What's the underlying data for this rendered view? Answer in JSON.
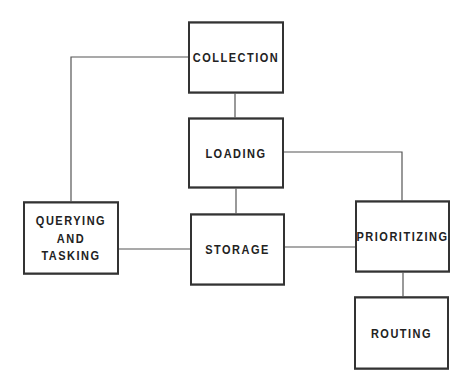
{
  "diagram": {
    "nodes": [
      {
        "id": "collection",
        "label": "COLLECTION"
      },
      {
        "id": "loading",
        "label": "LOADING"
      },
      {
        "id": "querying",
        "label": "QUERYING\nAND\nTASKING"
      },
      {
        "id": "storage",
        "label": "STORAGE"
      },
      {
        "id": "prioritizing",
        "label": "PRIORITIZING"
      },
      {
        "id": "routing",
        "label": "ROUTING"
      }
    ],
    "edges": [
      {
        "from": "collection",
        "to": "loading"
      },
      {
        "from": "collection",
        "to": "querying"
      },
      {
        "from": "loading",
        "to": "storage"
      },
      {
        "from": "loading",
        "to": "prioritizing"
      },
      {
        "from": "querying",
        "to": "storage"
      },
      {
        "from": "storage",
        "to": "prioritizing"
      },
      {
        "from": "prioritizing",
        "to": "routing"
      }
    ]
  }
}
